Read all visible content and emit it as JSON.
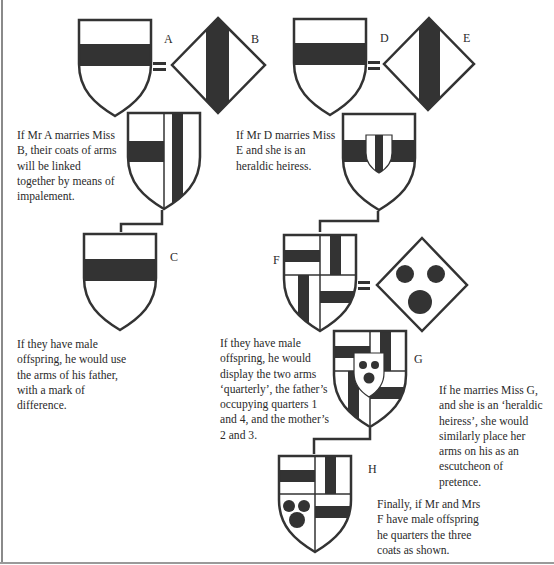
{
  "colors": {
    "ink": "#333333",
    "sable": "#333333",
    "field": "#ffffff",
    "text": "#2a2a2a"
  },
  "labels": {
    "A": "A",
    "B": "B",
    "C": "C",
    "D": "D",
    "E": "E",
    "F": "F",
    "G": "G",
    "H": "H"
  },
  "symbols": {
    "equals": "="
  },
  "captions": {
    "impalement": "If Mr A marries Miss B, their coats of arms will be linked together by means of impalement.",
    "heiress": "If Mr D marries Miss E and she is an heraldic heiress.",
    "difference": "If they have male offspring, he would use the arms of his father, with a mark of difference.",
    "quarterly": "If they have male offspring, he would display the two arms ‘quarterly’, the father’s occupying quarters 1 and 4, and the mother’s 2 and 3.",
    "pretence": "If he marries Miss G, and she is an ‘heraldic heiress’, she would similarly place her arms on his as an escutcheon of pretence.",
    "final": "Finally, if Mr and Mrs F have male offspring he quarters the three coats as shown."
  },
  "figures": [
    {
      "id": "A",
      "shape": "shield",
      "charge": "fess"
    },
    {
      "id": "B",
      "shape": "lozenge",
      "charge": "pale"
    },
    {
      "id": "A+B",
      "shape": "shield",
      "charge": "impaled: fess | pale"
    },
    {
      "id": "C",
      "shape": "shield",
      "charge": "fess"
    },
    {
      "id": "D",
      "shape": "shield",
      "charge": "fess"
    },
    {
      "id": "E",
      "shape": "lozenge",
      "charge": "pale"
    },
    {
      "id": "D+E",
      "shape": "shield",
      "charge": "fess with escutcheon of pretence bearing pale"
    },
    {
      "id": "F",
      "shape": "shield",
      "charge": "quarterly: fess, pale, pale, fess"
    },
    {
      "id": "G",
      "shape": "lozenge",
      "charge": "three roundels"
    },
    {
      "id": "F+G",
      "shape": "shield",
      "charge": "quarterly with escutcheon of pretence bearing three roundels"
    },
    {
      "id": "H",
      "shape": "shield",
      "charge": "quarterly: fess, pale, three roundels, fess"
    }
  ]
}
